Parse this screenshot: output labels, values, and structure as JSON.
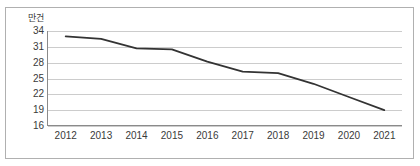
{
  "title_remnant": "",
  "chart_data": {
    "type": "line",
    "title": "",
    "xlabel": "",
    "ylabel": "만건",
    "unit_label": "만건",
    "categories": [
      "2012",
      "2013",
      "2014",
      "2015",
      "2016",
      "2017",
      "2018",
      "2019",
      "2020",
      "2021"
    ],
    "values": [
      33.0,
      32.5,
      30.7,
      30.5,
      28.2,
      26.3,
      26.0,
      24.0,
      21.5,
      19.0
    ],
    "series": [
      {
        "name": "건수",
        "values": [
          33.0,
          32.5,
          30.7,
          30.5,
          28.2,
          26.3,
          26.0,
          24.0,
          21.5,
          19.0
        ]
      }
    ],
    "ytick_labels": [
      "34",
      "31",
      "28",
      "25",
      "22",
      "19",
      "16"
    ],
    "ytick_values": [
      34,
      31,
      28,
      25,
      22,
      19,
      16
    ],
    "ylim": [
      16,
      34
    ],
    "ytick_step": 3,
    "grid": true,
    "legend": "none",
    "line_color": "#333333",
    "grid_color": "#cccccc",
    "axis_color": "#8a8a8a",
    "frame_color": "#b0b0b0",
    "background_color": "#ffffff"
  }
}
